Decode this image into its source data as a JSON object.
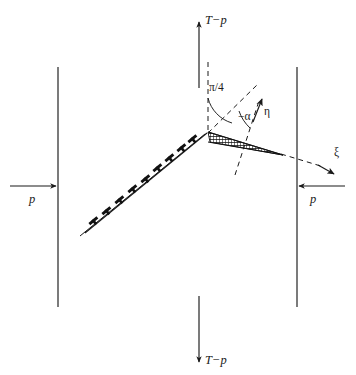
{
  "figure": {
    "caption_labels": {
      "tension_top": "T−p",
      "tension_bottom": "T−p",
      "pressure_left": "p",
      "pressure_right": "p",
      "angle_pi_over_4": "π/4",
      "angle_minus_alpha": "−α",
      "axis_eta": "η",
      "axis_xi": "ξ"
    },
    "colors": {
      "ink": "#1a1a1a",
      "background": "#ffffff",
      "hatch": "#111111"
    },
    "geometry": {
      "apex": [
        208,
        133
      ],
      "left_boundary_x": 58,
      "right_boundary_x": 297,
      "boundary_top_y": 67,
      "boundary_bottom_y": 307,
      "vertical_dashed_top_y": 62,
      "slip_line_start": [
        82,
        232
      ],
      "wedge_tip": [
        283,
        155
      ],
      "eta_arrow_tip": [
        262,
        100
      ],
      "xi_arrow_tip": [
        332,
        172
      ]
    }
  }
}
